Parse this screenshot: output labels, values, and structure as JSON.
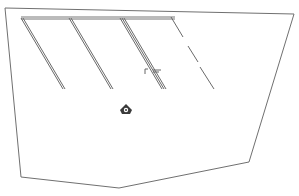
{
  "diagram": {
    "type": "floor-plan-sketch",
    "background": "#ffffff",
    "stroke_color": "#6e6e6e",
    "dark_stroke": "#555555",
    "outline_points": "5,9 193,13 149,98 122,... ",
    "labels": []
  }
}
